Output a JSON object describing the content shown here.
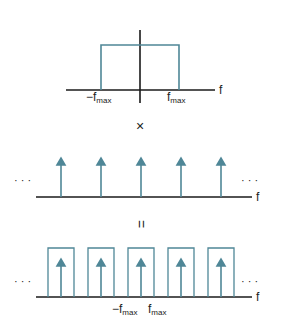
{
  "colors": {
    "axis": "#1a1a1a",
    "signal": "#4f8797",
    "text": "#222222"
  },
  "panel_top": {
    "axis_label": "f",
    "left_label_prefix": "−f",
    "left_label_sub": "max",
    "right_label_prefix": "f",
    "right_label_sub": "max"
  },
  "operator_multiply": "×",
  "panel_middle": {
    "axis_label": "f",
    "ellipsis_left": "· · ·",
    "ellipsis_right": "· · ·",
    "impulse_count": 5
  },
  "operator_equals": "=",
  "panel_bottom": {
    "axis_label": "f",
    "ellipsis_left": "· · ·",
    "ellipsis_right": "· · ·",
    "left_label_prefix": "−f",
    "left_label_sub": "max",
    "right_label_prefix": "f",
    "right_label_sub": "max",
    "replica_count": 5
  }
}
